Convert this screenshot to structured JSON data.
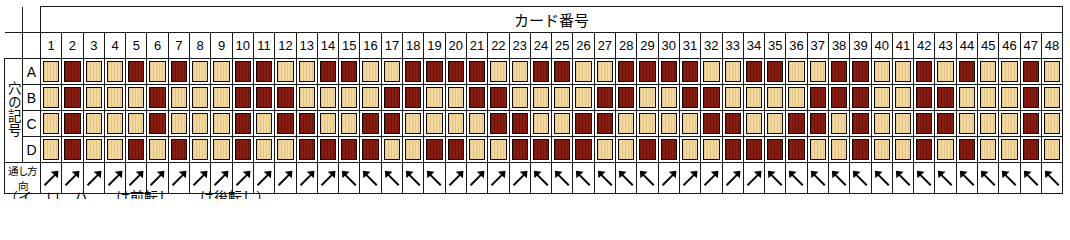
{
  "header": {
    "card_number_title": "カード番号",
    "hole_symbol_label": "穴の記号",
    "direction_label": "通し方向"
  },
  "caption": "（イ、ロ、ハ、…は前転し、…は後転し）",
  "colors": {
    "tan": "#f2d9a0",
    "dark_red": "#8d1c10",
    "border": "#1a1a1a",
    "background": "#ffffff"
  },
  "columns": [
    1,
    2,
    3,
    4,
    5,
    6,
    7,
    8,
    9,
    10,
    11,
    12,
    13,
    14,
    15,
    16,
    17,
    18,
    19,
    20,
    21,
    22,
    23,
    24,
    25,
    26,
    27,
    28,
    29,
    30,
    31,
    32,
    33,
    34,
    35,
    36,
    37,
    38,
    39,
    40,
    41,
    42,
    43,
    44,
    45,
    46,
    47,
    48
  ],
  "row_labels": [
    "A",
    "B",
    "C",
    "D"
  ],
  "chart_data": {
    "type": "heatmap",
    "title": "カード番号",
    "xlabel": "カード番号",
    "ylabel": "穴の記号",
    "categories": [
      1,
      2,
      3,
      4,
      5,
      6,
      7,
      8,
      9,
      10,
      11,
      12,
      13,
      14,
      15,
      16,
      17,
      18,
      19,
      20,
      21,
      22,
      23,
      24,
      25,
      26,
      27,
      28,
      29,
      30,
      31,
      32,
      33,
      34,
      35,
      36,
      37,
      38,
      39,
      40,
      41,
      42,
      43,
      44,
      45,
      46,
      47,
      48
    ],
    "value_legend": {
      "0": "tan",
      "1": "dark_red"
    },
    "series": [
      {
        "name": "A",
        "values": [
          0,
          1,
          0,
          0,
          1,
          0,
          1,
          0,
          0,
          1,
          1,
          0,
          0,
          1,
          1,
          0,
          0,
          1,
          1,
          1,
          1,
          0,
          0,
          1,
          1,
          0,
          0,
          1,
          1,
          1,
          1,
          0,
          0,
          1,
          1,
          0,
          0,
          1,
          1,
          0,
          0,
          1,
          0,
          1,
          0,
          0,
          1,
          0
        ]
      },
      {
        "name": "B",
        "values": [
          0,
          1,
          0,
          0,
          0,
          1,
          0,
          0,
          0,
          1,
          1,
          1,
          0,
          0,
          0,
          0,
          1,
          1,
          0,
          0,
          1,
          1,
          0,
          0,
          0,
          0,
          1,
          1,
          0,
          0,
          1,
          1,
          0,
          0,
          0,
          0,
          1,
          1,
          1,
          0,
          0,
          1,
          1,
          0,
          0,
          0,
          1,
          0
        ]
      },
      {
        "name": "C",
        "values": [
          0,
          1,
          0,
          0,
          0,
          1,
          0,
          0,
          0,
          1,
          0,
          1,
          1,
          0,
          0,
          1,
          1,
          0,
          0,
          0,
          0,
          1,
          1,
          0,
          0,
          1,
          1,
          0,
          0,
          0,
          0,
          1,
          1,
          0,
          0,
          1,
          1,
          0,
          1,
          0,
          0,
          1,
          1,
          0,
          0,
          0,
          1,
          0
        ]
      },
      {
        "name": "D",
        "values": [
          0,
          1,
          0,
          0,
          1,
          0,
          1,
          0,
          0,
          1,
          0,
          0,
          1,
          1,
          1,
          1,
          0,
          0,
          1,
          1,
          0,
          0,
          1,
          1,
          1,
          1,
          0,
          0,
          1,
          1,
          0,
          0,
          1,
          1,
          1,
          1,
          0,
          0,
          1,
          0,
          0,
          1,
          0,
          1,
          0,
          0,
          1,
          0
        ]
      }
    ],
    "direction_row": {
      "name": "通し方向",
      "legend": {
        "ne": "up-right arrow",
        "nw": "up-left arrow"
      },
      "values": [
        "ne",
        "ne",
        "ne",
        "ne",
        "ne",
        "ne",
        "ne",
        "ne",
        "ne",
        "ne",
        "ne",
        "ne",
        "ne",
        "ne",
        "nw",
        "nw",
        "nw",
        "nw",
        "nw",
        "ne",
        "ne",
        "ne",
        "ne",
        "nw",
        "nw",
        "nw",
        "nw",
        "nw",
        "nw",
        "ne",
        "ne",
        "ne",
        "ne",
        "ne",
        "nw",
        "nw",
        "nw",
        "nw",
        "nw",
        "nw",
        "nw",
        "nw",
        "nw",
        "nw",
        "nw",
        "nw",
        "nw",
        "nw"
      ]
    }
  }
}
